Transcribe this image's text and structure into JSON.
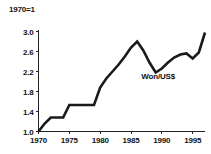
{
  "figure": {
    "unit_note": "1970=1"
  },
  "chart_data": {
    "type": "line",
    "title": "",
    "subtitle": "",
    "xlabel": "",
    "ylabel": "1970=1",
    "xlim": [
      1970,
      1997
    ],
    "ylim": [
      1.0,
      3.0
    ],
    "grid": false,
    "legend_position": "inline-annotation",
    "y_ticks": [
      "3.0",
      "2.6",
      "2.2",
      "1.8",
      "1.4",
      "1.0"
    ],
    "y_tick_values": [
      3.0,
      2.6,
      2.2,
      1.8,
      1.4,
      1.0
    ],
    "x_ticks": [
      "1970",
      "1975",
      "1980",
      "1985",
      "1990",
      "1995"
    ],
    "x_tick_values": [
      1970,
      1975,
      1980,
      1985,
      1990,
      1995
    ],
    "annotations": [
      {
        "text": "Won/US$",
        "x": 1989.4,
        "y": 2.06
      }
    ],
    "series": [
      {
        "name": "Won/US$",
        "x": [
          1970,
          1971,
          1972,
          1973,
          1974,
          1975,
          1976,
          1977,
          1978,
          1979,
          1980,
          1981,
          1982,
          1983,
          1984,
          1985,
          1986,
          1987,
          1988,
          1989,
          1990,
          1991,
          1992,
          1993,
          1994,
          1995,
          1996,
          1997
        ],
        "values": [
          1.0,
          1.16,
          1.28,
          1.28,
          1.28,
          1.53,
          1.53,
          1.53,
          1.53,
          1.53,
          1.88,
          2.06,
          2.2,
          2.34,
          2.5,
          2.68,
          2.8,
          2.62,
          2.38,
          2.18,
          2.26,
          2.38,
          2.48,
          2.54,
          2.56,
          2.46,
          2.58,
          2.98
        ]
      }
    ]
  }
}
